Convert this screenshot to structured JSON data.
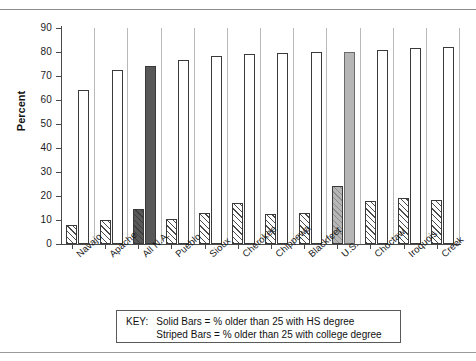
{
  "chart_data": {
    "type": "bar",
    "title": "",
    "xlabel": "",
    "ylabel": "Percent",
    "ylim": [
      0,
      90
    ],
    "yticks": [
      0,
      10,
      20,
      30,
      40,
      50,
      60,
      70,
      80,
      90
    ],
    "grid": false,
    "legend_position": "below-plot",
    "categories": [
      "Navajo",
      "Apache",
      "All N.A.",
      "Pueblo",
      "Sioux",
      "Cherokee",
      "Chippewa",
      "Blackfeet",
      "U.S.",
      "Choctaw",
      "Iroquois",
      "Creek"
    ],
    "series": [
      {
        "name": "Solid Bars = % older than 25 with HS degree",
        "style": "solid",
        "values": [
          64,
          72.5,
          74,
          76.5,
          78.5,
          79,
          79.5,
          80,
          80,
          81,
          81.5,
          82
        ]
      },
      {
        "name": "Striped Bars = % older than 25 with college degree",
        "style": "striped",
        "values": [
          8,
          10,
          14.5,
          10.5,
          13,
          17,
          12.5,
          13,
          24,
          18,
          19,
          18.5
        ]
      }
    ],
    "highlights": {
      "All N.A.": "dark",
      "U.S.": "gray"
    }
  },
  "key": {
    "label": "KEY:",
    "line1": "Solid Bars = % older than 25 with HS degree",
    "line2": "Striped Bars = % older than 25 with college degree"
  },
  "colors": {
    "axis": "#4a4a4a",
    "bar_outline": "#3a3a3a",
    "highlight_dark": "#585858",
    "highlight_gray": "#b6b6b6",
    "text": "#141414"
  }
}
